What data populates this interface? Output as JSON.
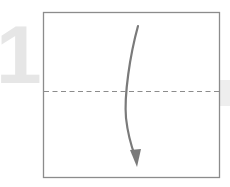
{
  "step": {
    "number": "1"
  },
  "diagram": {
    "paper": {
      "x": 43,
      "y": 12,
      "width": 176,
      "height": 165,
      "stroke": "#8c8c8c",
      "fill": "#ffffff"
    },
    "fold_line": {
      "type": "valley-dashed",
      "y": 91,
      "stroke": "#8c8c8c"
    },
    "arrow": {
      "direction": "down",
      "from": [
        138,
        26
      ],
      "to": [
        136,
        166
      ],
      "color": "#7a7a7a"
    },
    "colors": {
      "step_number": "#e6e6e6",
      "side_block": "#eeeeee"
    }
  }
}
